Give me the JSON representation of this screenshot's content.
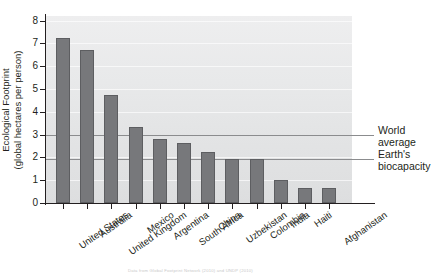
{
  "chart_data": {
    "type": "bar",
    "title": "",
    "subtitle": "",
    "xlabel": "",
    "ylabel_line1": "Ecological Footprint",
    "ylabel_line2": "(global hectares per person)",
    "categories": [
      "United States",
      "Australia",
      "United Kingdom",
      "Mexico",
      "Argentina",
      "South Africa",
      "China",
      "Uzbekistan",
      "Colombia",
      "India",
      "Haiti",
      "Afghanistan"
    ],
    "values": [
      7.25,
      6.7,
      4.75,
      3.35,
      2.8,
      2.65,
      2.25,
      1.95,
      1.95,
      1.0,
      0.65,
      0.65
    ],
    "ylim": [
      0,
      8.2
    ],
    "yticks": [
      0,
      1,
      2,
      3,
      4,
      5,
      6,
      7,
      8
    ],
    "ytick_labels": [
      "0",
      "1",
      "2",
      "3",
      "4",
      "5",
      "6",
      "7",
      "8"
    ],
    "grid": true,
    "legend": "none",
    "bar_color": "#77787b",
    "bar_edge_color": "#5d5e61",
    "plot_bg_color": "#e6e7e8",
    "reference_lines": [
      {
        "label_line1": "World",
        "label_line2": "average",
        "value": 2.98,
        "color": "#8b8c8e"
      },
      {
        "label_line1": "Earth's",
        "label_line2": "biocapacity",
        "value": 1.92,
        "color": "#8b8c8e"
      }
    ],
    "annotations": [
      {
        "text": "World average"
      },
      {
        "text": "Earth's biocapacity"
      }
    ]
  },
  "caption": {
    "text": "Data from Global Footprint Network (2010) and UNDP (2010)"
  }
}
